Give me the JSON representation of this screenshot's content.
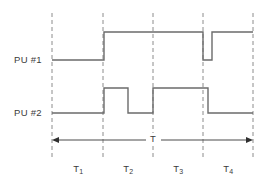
{
  "diagram": {
    "type": "timing-diagram",
    "signals": [
      {
        "name": "pu1",
        "label": "PU #1",
        "label_x": 14,
        "label_y": 54,
        "high_y": 32,
        "low_y": 60,
        "start_x": 52,
        "end_x": 253,
        "initial_level": "low",
        "transitions": [
          {
            "x": 104,
            "to": "high"
          },
          {
            "x": 203,
            "to": "low"
          },
          {
            "x": 212,
            "to": "high"
          }
        ]
      },
      {
        "name": "pu2",
        "label": "PU #2",
        "label_x": 14,
        "label_y": 107,
        "high_y": 88,
        "low_y": 113,
        "start_x": 52,
        "end_x": 253,
        "initial_level": "low",
        "transitions": [
          {
            "x": 104,
            "to": "high"
          },
          {
            "x": 128,
            "to": "low"
          },
          {
            "x": 153,
            "to": "high"
          },
          {
            "x": 208,
            "to": "low"
          }
        ]
      }
    ],
    "gridlines": [
      {
        "name": "t0",
        "x": 52
      },
      {
        "name": "t1",
        "x": 103
      },
      {
        "name": "t2",
        "x": 153
      },
      {
        "name": "t3",
        "x": 203
      },
      {
        "name": "t4",
        "x": 253
      }
    ],
    "gridline_top": 13,
    "gridline_bottom": 160,
    "period_arrow": {
      "name": "period-arrow",
      "y": 140,
      "x_start": 52,
      "x_end": 253,
      "label": "T",
      "label_x": 153,
      "label_y": 133
    },
    "intervals": [
      {
        "name": "t1",
        "label": "T",
        "subscript": "1",
        "center_x": 78,
        "y": 163
      },
      {
        "name": "t2",
        "label": "T",
        "subscript": "2",
        "center_x": 128,
        "y": 163
      },
      {
        "name": "t3",
        "label": "T",
        "subscript": "3",
        "center_x": 178,
        "y": 163
      },
      {
        "name": "t4",
        "label": "T",
        "subscript": "4",
        "center_x": 228,
        "y": 163
      }
    ],
    "colors": {
      "background": "#ffffff",
      "waveform": "#6b6b6b",
      "gridline": "#8c8c8c",
      "arrow": "#4a4a4a",
      "text": "#3b3b3b"
    }
  }
}
